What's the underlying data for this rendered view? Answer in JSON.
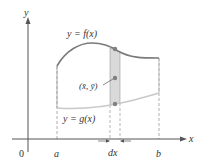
{
  "diagram": {
    "axes": {
      "x_label": "x",
      "y_label": "y",
      "origin_label": "0"
    },
    "bounds": {
      "left_label": "a",
      "right_label": "b"
    },
    "curves": {
      "upper_label": "y = f(x)",
      "lower_label": "y = g(x)"
    },
    "strip": {
      "width_label": "dx",
      "centroid_label": "(x̄, ȳ)"
    },
    "colors": {
      "axis": "#555555",
      "upper_curve": "#7a7a7a",
      "lower_curve": "#c8c8c8",
      "strip_fill": "#d9d9d9",
      "point": "#808080",
      "dashed": "#9a9a9a",
      "text": "#333333"
    }
  }
}
